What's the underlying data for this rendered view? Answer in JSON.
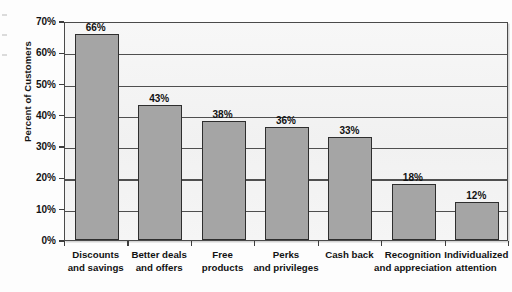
{
  "chart_data": {
    "type": "bar",
    "title": "",
    "xlabel": "",
    "ylabel": "Percent of Customers",
    "ylim": [
      0,
      70
    ],
    "ytick_step": 10,
    "grid": true,
    "legend": false,
    "value_suffix": "%",
    "categories": [
      "Discounts and savings",
      "Better deals and offers",
      "Free products",
      "Perks and privileges",
      "Cash back",
      "Recognition and appreciation",
      "Individualized attention"
    ],
    "category_lines": [
      [
        "Discounts",
        "and savings"
      ],
      [
        "Better deals",
        "and offers"
      ],
      [
        "Free",
        "products"
      ],
      [
        "Perks",
        "and privileges"
      ],
      [
        "Cash back",
        ""
      ],
      [
        "Recognition",
        "and appreciation"
      ],
      [
        "Individualized",
        "attention"
      ]
    ],
    "values": [
      66,
      43,
      38,
      36,
      33,
      18,
      12
    ],
    "value_labels": [
      "66%",
      "43%",
      "38%",
      "36%",
      "33%",
      "18%",
      "12%"
    ],
    "ytick_labels": [
      "0%",
      "10%",
      "20%",
      "30%",
      "40%",
      "50%",
      "60%",
      "70%"
    ],
    "ytick_values": [
      0,
      10,
      20,
      30,
      40,
      50,
      60,
      70
    ],
    "colors": {
      "bar_fill": "#a5a5a5",
      "bar_stroke": "#2e2e2e",
      "plot_background": "#f4f4f4",
      "gridline": "#4f4f4f",
      "axis": "#3d3d3d",
      "text": "#121212",
      "page_background": "#fdfdfd"
    }
  }
}
